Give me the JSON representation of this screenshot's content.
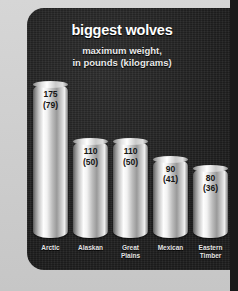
{
  "chart_data": {
    "type": "bar",
    "title": "biggest wolves",
    "subtitle_line1": "maximum weight,",
    "subtitle_line2": "in pounds (kilograms)",
    "xlabel": "",
    "ylabel": "maximum weight, in pounds (kilograms)",
    "ylim": [
      0,
      175
    ],
    "grid": false,
    "legend": "none",
    "categories": [
      "Arctic",
      "Alaskan",
      "Great Plains",
      "Mexican",
      "Eastern Timber"
    ],
    "values": [
      175,
      110,
      110,
      90,
      80
    ],
    "values_kg": [
      79,
      50,
      50,
      41,
      36
    ],
    "bars": [
      {
        "category_line1": "Arctic",
        "category_line2": "",
        "pounds": "175",
        "kilograms": "(79)",
        "value": 175
      },
      {
        "category_line1": "Alaskan",
        "category_line2": "",
        "pounds": "110",
        "kilograms": "(50)",
        "value": 110
      },
      {
        "category_line1": "Great",
        "category_line2": "Plains",
        "pounds": "110",
        "kilograms": "(50)",
        "value": 110
      },
      {
        "category_line1": "Mexican",
        "category_line2": "",
        "pounds": "90",
        "kilograms": "(41)",
        "value": 90
      },
      {
        "category_line1": "Eastern",
        "category_line2": "Timber",
        "pounds": "80",
        "kilograms": "(36)",
        "value": 80
      }
    ]
  },
  "colors": {
    "panel_background": "#242424",
    "page_background": "#cdcdcd",
    "title_text": "#ffffff",
    "subtitle_text": "#e9e9e9",
    "category_text": "#e4e4e4",
    "bar_value_text": "#141414",
    "bar_highlight": "#fdfdfd",
    "bar_shadow": "#5d5d5d"
  }
}
